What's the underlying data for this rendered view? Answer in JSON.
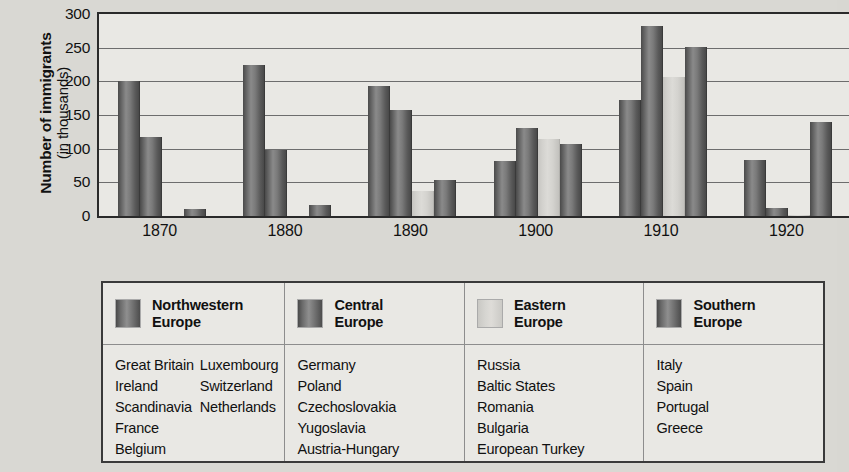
{
  "chart_data": {
    "type": "bar",
    "title": "",
    "xlabel": "",
    "ylabel": "Number of immigrants (in thousands)",
    "ylabel_main": "Number of immigrants",
    "ylabel_sub": "(in thousands)",
    "categories": [
      "1870",
      "1880",
      "1890",
      "1900",
      "1910",
      "1920"
    ],
    "ylim": [
      0,
      300
    ],
    "yticks": [
      300,
      250,
      200,
      150,
      100,
      50,
      0
    ],
    "grid": true,
    "legend_position": "below",
    "series": [
      {
        "name": "Northwestern Europe",
        "color": "#6b6b6b",
        "values": [
          200,
          225,
          193,
          82,
          173,
          83
        ]
      },
      {
        "name": "Central Europe",
        "color": "#6b6b6b",
        "values": [
          118,
          98,
          157,
          130,
          282,
          12
        ]
      },
      {
        "name": "Eastern Europe",
        "color": "#d6d5d1",
        "values": [
          0,
          0,
          37,
          115,
          206,
          2
        ]
      },
      {
        "name": "Southern Europe",
        "color": "#6b6b6b",
        "values": [
          10,
          17,
          54,
          107,
          251,
          140
        ]
      }
    ]
  },
  "legend": {
    "columns": [
      {
        "title_line1": "Northwestern",
        "title_line2": "Europe",
        "swatch": "dark",
        "countries_col1": [
          "Great Britain",
          "Ireland",
          "Scandinavia",
          "France",
          "Belgium"
        ],
        "countries_col2": [
          "Luxembourg",
          "Switzerland",
          "Netherlands"
        ]
      },
      {
        "title_line1": "Central",
        "title_line2": "Europe",
        "swatch": "dark",
        "countries_col1": [
          "Germany",
          "Poland",
          "Czechoslovakia",
          "Yugoslavia",
          "Austria-Hungary"
        ],
        "countries_col2": []
      },
      {
        "title_line1": "Eastern",
        "title_line2": "Europe",
        "swatch": "light",
        "countries_col1": [
          "Russia",
          "Baltic States",
          "Romania",
          "Bulgaria",
          "European Turkey"
        ],
        "countries_col2": []
      },
      {
        "title_line1": "Southern",
        "title_line2": "Europe",
        "swatch": "dark",
        "countries_col1": [
          "Italy",
          "Spain",
          "Portugal",
          "Greece"
        ],
        "countries_col2": []
      }
    ]
  }
}
